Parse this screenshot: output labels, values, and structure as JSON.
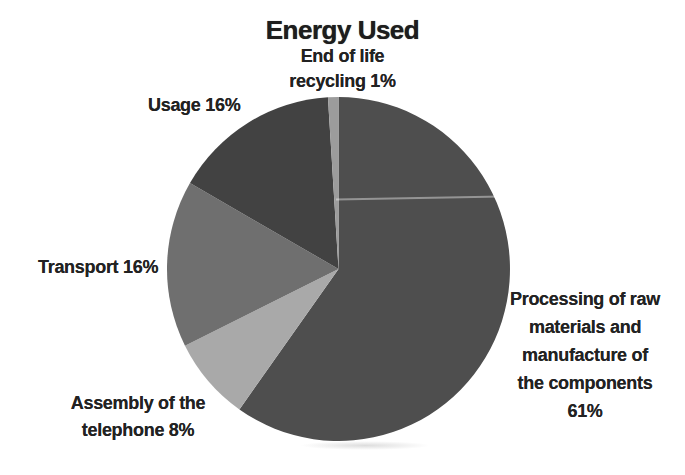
{
  "chart_data": {
    "type": "pie",
    "title": "Energy Used",
    "legend": "none",
    "labels_position": "outside",
    "start_angle_deg": 0,
    "direction": "clockwise",
    "slices": [
      {
        "id": "processing",
        "name": "Processing of raw materials and manufacture of the components",
        "value": 61,
        "unit": "%",
        "color": "#4e4e4e",
        "label": "Processing of raw\nmaterials and\nmanufacture of\nthe components\n61%"
      },
      {
        "id": "assembly",
        "name": "Assembly of the telephone",
        "value": 8,
        "unit": "%",
        "color": "#a9a9a9",
        "label": "Assembly of the\ntelephone 8%"
      },
      {
        "id": "transport",
        "name": "Transport",
        "value": 16,
        "unit": "%",
        "color": "#6f6f6f",
        "label": "Transport 16%"
      },
      {
        "id": "usage",
        "name": "Usage",
        "value": 16,
        "unit": "%",
        "color": "#424242",
        "label": "Usage 16%"
      },
      {
        "id": "end-of-life",
        "name": "End of life recycling",
        "value": 1,
        "unit": "%",
        "color": "#9c9c9c",
        "label": "End of life\nrecycling 1%"
      }
    ]
  }
}
